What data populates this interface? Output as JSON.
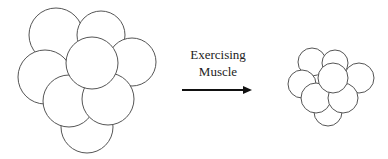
{
  "diagram": {
    "label_line1": "Exercising",
    "label_line2": "Muscle",
    "arrow": {
      "x1": 182,
      "y1": 90,
      "x2": 252,
      "y2": 90,
      "color": "#111111"
    },
    "before_cluster": {
      "name": "large-cell-cluster",
      "circles": [
        {
          "cx": 56,
          "cy": 35,
          "r": 27
        },
        {
          "cx": 101,
          "cy": 35,
          "r": 24
        },
        {
          "cx": 132,
          "cy": 62,
          "r": 24
        },
        {
          "cx": 45,
          "cy": 77,
          "r": 27
        },
        {
          "cx": 87,
          "cy": 127,
          "r": 26
        },
        {
          "cx": 69,
          "cy": 101,
          "r": 26
        },
        {
          "cx": 108,
          "cy": 99,
          "r": 26
        },
        {
          "cx": 92,
          "cy": 63,
          "r": 26
        }
      ]
    },
    "after_cluster": {
      "name": "small-cell-cluster",
      "circles": [
        {
          "cx": 312,
          "cy": 62,
          "r": 14
        },
        {
          "cx": 335,
          "cy": 63,
          "r": 13
        },
        {
          "cx": 359,
          "cy": 78,
          "r": 15
        },
        {
          "cx": 302,
          "cy": 84,
          "r": 14
        },
        {
          "cx": 328,
          "cy": 112,
          "r": 14
        },
        {
          "cx": 316,
          "cy": 98,
          "r": 15
        },
        {
          "cx": 343,
          "cy": 98,
          "r": 15
        },
        {
          "cx": 333,
          "cy": 78,
          "r": 15
        }
      ]
    }
  }
}
